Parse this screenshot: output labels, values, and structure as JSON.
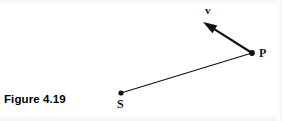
{
  "figure": {
    "caption": "Figure 4.19",
    "background_color": "#ffffff",
    "ink_color": "#111111",
    "width": 282,
    "height": 121
  },
  "labels": {
    "point_s": "S",
    "point_p": "P",
    "vector_v": "v"
  },
  "chart_data": {
    "type": "diagram",
    "title": "Figure 4.19",
    "points": [
      {
        "name": "S",
        "x": 121,
        "y": 93,
        "marker": "filled-dot",
        "label": "S",
        "label_position": "below"
      },
      {
        "name": "P",
        "x": 252,
        "y": 53,
        "marker": "filled-dot",
        "label": "P",
        "label_position": "right"
      }
    ],
    "segments": [
      {
        "name": "SP",
        "from": "S",
        "to": "P",
        "x1": 121,
        "y1": 93,
        "x2": 252,
        "y2": 53,
        "style": "plain-line",
        "stroke_width": 1.1
      }
    ],
    "vectors": [
      {
        "name": "v",
        "origin": "P",
        "x1": 252,
        "y1": 53,
        "x2": 203,
        "y2": 22,
        "arrowhead": "solid-triangle",
        "stroke_width": 2.1,
        "label": "v",
        "label_x": 208,
        "label_y": 11
      }
    ],
    "grid": false,
    "legend": false,
    "axes": false
  }
}
